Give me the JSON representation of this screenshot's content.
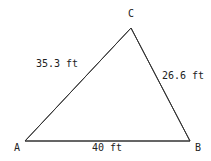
{
  "diagram": {
    "type": "triangle",
    "vertices": [
      {
        "id": "A",
        "label": "A"
      },
      {
        "id": "B",
        "label": "B"
      },
      {
        "id": "C",
        "label": "C"
      }
    ],
    "sides": [
      {
        "id": "AB",
        "label": "40 ft",
        "length_ft": 40
      },
      {
        "id": "BC",
        "label": "26.6 ft",
        "length_ft": 26.6
      },
      {
        "id": "AC",
        "label": "35.3 ft",
        "length_ft": 35.3
      }
    ],
    "line_color": "#333333"
  }
}
